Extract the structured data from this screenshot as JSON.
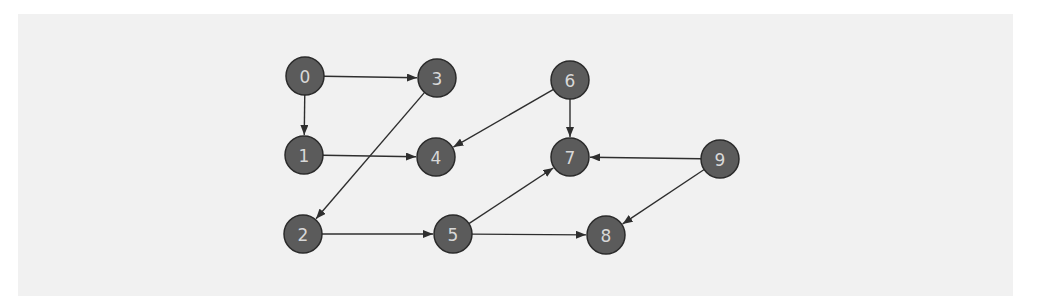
{
  "diagram": {
    "type": "directed-graph",
    "node_radius": 19,
    "colors": {
      "background": "#ffffff",
      "panel": "#f1f1f1",
      "node_fill": "#5b5b5b",
      "node_stroke": "#2a2a2a",
      "node_label": "#d8d8d8",
      "edge": "#2e2e2e"
    },
    "nodes": [
      {
        "id": "0",
        "label": "0",
        "x": 305,
        "y": 76
      },
      {
        "id": "1",
        "label": "1",
        "x": 304,
        "y": 155
      },
      {
        "id": "2",
        "label": "2",
        "x": 303,
        "y": 234
      },
      {
        "id": "3",
        "label": "3",
        "x": 437,
        "y": 78
      },
      {
        "id": "4",
        "label": "4",
        "x": 436,
        "y": 157
      },
      {
        "id": "5",
        "label": "5",
        "x": 453,
        "y": 234
      },
      {
        "id": "6",
        "label": "6",
        "x": 570,
        "y": 80
      },
      {
        "id": "7",
        "label": "7",
        "x": 570,
        "y": 157
      },
      {
        "id": "8",
        "label": "8",
        "x": 606,
        "y": 235
      },
      {
        "id": "9",
        "label": "9",
        "x": 720,
        "y": 159
      }
    ],
    "edges": [
      {
        "from": "0",
        "to": "3"
      },
      {
        "from": "0",
        "to": "1"
      },
      {
        "from": "1",
        "to": "4"
      },
      {
        "from": "3",
        "to": "2"
      },
      {
        "from": "6",
        "to": "4"
      },
      {
        "from": "6",
        "to": "7"
      },
      {
        "from": "2",
        "to": "5"
      },
      {
        "from": "5",
        "to": "7"
      },
      {
        "from": "5",
        "to": "8"
      },
      {
        "from": "9",
        "to": "7"
      },
      {
        "from": "9",
        "to": "8"
      }
    ]
  }
}
